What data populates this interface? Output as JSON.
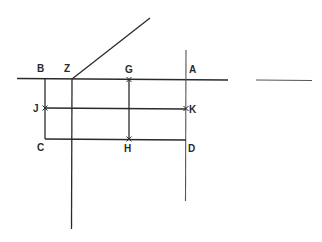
{
  "diagram": {
    "type": "geometric-construction",
    "labels": {
      "B": "B",
      "Z": "Z",
      "G": "G",
      "A": "A",
      "J": "J",
      "K": "K",
      "C": "C",
      "H": "H",
      "D": "D"
    },
    "points": {
      "B": [
        45,
        79
      ],
      "Z": [
        72,
        79
      ],
      "G": [
        129,
        79
      ],
      "A": [
        186,
        79
      ],
      "J": [
        45,
        108
      ],
      "K": [
        186,
        108
      ],
      "C": [
        45,
        139
      ],
      "H": [
        129,
        139
      ],
      "D": [
        186,
        139
      ]
    },
    "colors": {
      "line": "#2a2a2a",
      "background": "#ffffff"
    }
  }
}
